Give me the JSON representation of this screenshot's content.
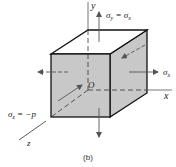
{
  "figure": {
    "caption": "(b)",
    "axes": {
      "x": "x",
      "y": "y",
      "z": "z",
      "origin": "O"
    },
    "stresses": {
      "sigma_y": "σ",
      "sigma_y_sub": "y",
      "sigma_y_eq": " = σ",
      "sigma_y_eq_sub": "x",
      "sigma_x": "σ",
      "sigma_x_sub": "x",
      "sigma_z": "σ",
      "sigma_z_sub": "z",
      "sigma_z_eq": " = −p"
    },
    "colors": {
      "face_fill": "#c8c8c8",
      "edge": "#111111",
      "arrow": "#555555",
      "background": "#ffffff"
    }
  }
}
